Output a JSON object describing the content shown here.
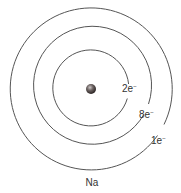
{
  "diagram": {
    "type": "bohr-atom-model",
    "element_label": "Na",
    "nucleus": {
      "cx": 91,
      "cy": 89,
      "r": 5
    },
    "shells": [
      {
        "r": 38,
        "label": "2e",
        "superscript": "−",
        "label_x": 122,
        "label_y": 92
      },
      {
        "r": 59,
        "label": "8e",
        "superscript": "−",
        "label_x": 139,
        "label_y": 118
      },
      {
        "r": 81,
        "label": "1e",
        "superscript": "−",
        "label_x": 151,
        "label_y": 144
      }
    ],
    "colors": {
      "shell": "#555555",
      "text": "#333333",
      "nucleus": "#3a3433"
    }
  }
}
